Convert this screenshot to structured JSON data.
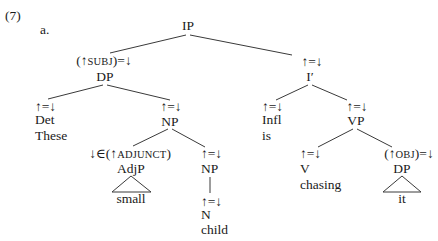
{
  "example_number": "(7)",
  "sub_label": "a.",
  "tree": {
    "root": {
      "label": "IP"
    },
    "subj": {
      "annotation_prefix": "(↑",
      "annotation_sc": "SUBJ",
      "annotation_suffix": ")=↓",
      "label": "DP"
    },
    "det": {
      "annotation": "↑=↓",
      "label": "Det",
      "word": "These"
    },
    "np_upper": {
      "annotation": "↑=↓",
      "label": "NP"
    },
    "adjp": {
      "annotation_prefix": "↓∈(↑",
      "annotation_sc": "ADJUNCT",
      "annotation_suffix": ")",
      "label": "AdjP",
      "word": "small"
    },
    "np_lower": {
      "annotation": "↑=↓",
      "label": "NP"
    },
    "n": {
      "annotation": "↑=↓",
      "label": "N",
      "word": "child"
    },
    "ibar": {
      "annotation": "↑=↓",
      "label": "I′"
    },
    "infl": {
      "annotation": "↑=↓",
      "label": "Infl",
      "word": "is"
    },
    "vp": {
      "annotation": "↑=↓",
      "label": "VP"
    },
    "v": {
      "annotation": "↑=↓",
      "label": "V",
      "word": "chasing"
    },
    "obj": {
      "annotation_prefix": "(↑",
      "annotation_sc": "OBJ",
      "annotation_suffix": ")=↓",
      "label": "DP",
      "word": "it"
    }
  },
  "colors": {
    "line": "#3a3a3a",
    "text": "#1a1a1a",
    "background": "#ffffff"
  }
}
